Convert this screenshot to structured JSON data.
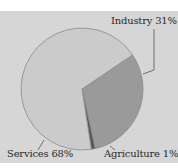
{
  "chart_data": {
    "type": "pie",
    "title": "",
    "categories": [
      "Industry",
      "Agriculture",
      "Services"
    ],
    "values": [
      31,
      1,
      68
    ],
    "labels": [
      "Industry 31%",
      "Agriculture 1%",
      "Services 68%"
    ],
    "colors": [
      "#9a9a9a",
      "#555555",
      "#cbcbcb"
    ],
    "legend": "none (direct labels with leader lines)"
  },
  "labels": {
    "industry": "Industry 31%",
    "agriculture": "Agriculture 1%",
    "services": "Services 68%"
  },
  "colors": {
    "background": "#d6d6d6",
    "industry": "#9a9a9a",
    "agriculture": "#555555",
    "services": "#cbcbcb",
    "outline": "#8a8a8a"
  }
}
